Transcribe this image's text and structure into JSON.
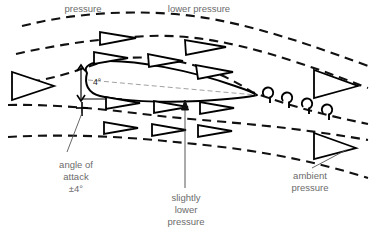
{
  "diagram": {
    "labels": {
      "top_left": "pressure",
      "top_center": "lower pressure",
      "angle_value": "4°",
      "bottom_left_line1": "angle of",
      "bottom_left_line2": "attack",
      "bottom_left_line3": "±4°",
      "bottom_center_line1": "slightly",
      "bottom_center_line2": "lower",
      "bottom_center_line3": "pressure",
      "bottom_right_line1": "ambient",
      "bottom_right_line2": "pressure"
    },
    "colors": {
      "background": "#ffffff",
      "stroke": "#111111",
      "label_text": "#6b6b6b",
      "chord_line": "#888888",
      "leader_line": "#555555"
    },
    "elements": {
      "airfoil": "airfoil-cross-section",
      "streamlines_count": 5,
      "flow_arrows": "hollow-triangle",
      "vortices_count": 4,
      "inlet_arrow": "large-flow-arrow-left",
      "outlet_arrows_count": 2
    }
  }
}
